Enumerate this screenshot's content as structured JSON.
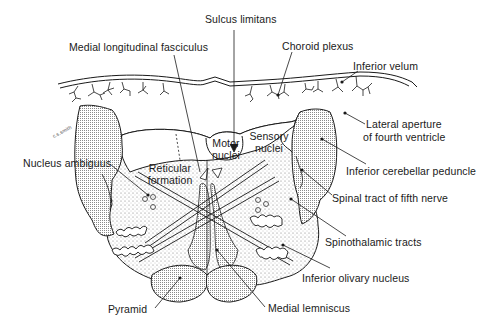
{
  "figure": {
    "colors": {
      "ink": "#1a1a1a",
      "stipple_fill": "#d8d8d8",
      "dense_fill": "#bdbdbd",
      "background": "#ffffff"
    }
  },
  "labels": {
    "sulcus_limitans": "Sulcus limitans",
    "medial_longitudinal_fasciculus": "Medial longitudinal fasciculus",
    "choroid_plexus": "Choroid plexus",
    "inferior_velum": "Inferior velum",
    "lateral_aperture_line1": "Lateral aperture",
    "lateral_aperture_line2": "of fourth ventricle",
    "motor_nuclei_line1": "Motor",
    "motor_nuclei_line2": "nuclei",
    "sensory_nuclei_line1": "Sensory",
    "sensory_nuclei_line2": "nuclei",
    "nucleus_ambiguus": "Nucleus ambiguus",
    "reticular_formation_line1": "Reticular",
    "reticular_formation_line2": "formation",
    "inferior_cerebellar_peduncle": "Inferior cerebellar peduncle",
    "spinal_tract_fifth_nerve": "Spinal tract of fifth nerve",
    "spinothalamic_tracts": "Spinothalamic tracts",
    "inferior_olivary_nucleus": "Inferior olivary nucleus",
    "pyramid": "Pyramid",
    "medial_lemniscus": "Medial lemniscus",
    "artist_signature": "c.s.smith"
  }
}
